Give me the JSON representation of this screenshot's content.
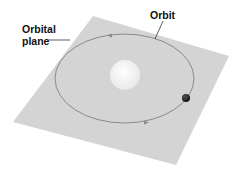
{
  "labels": {
    "orbital_plane_line1": "Orbital",
    "orbital_plane_line2": "plane",
    "orbit": "Orbit"
  },
  "colors": {
    "plane": "#d4d4d4",
    "orbit": "#8a8a8a",
    "sun": "#f2f2f2",
    "planet": "#1c1c1c",
    "leader": "#333333"
  }
}
